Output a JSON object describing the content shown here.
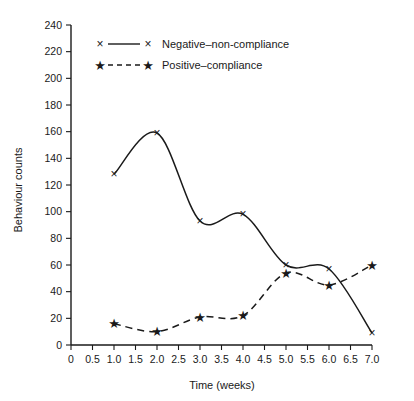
{
  "chart_data": {
    "type": "line",
    "title": "",
    "subtitle": "",
    "xlabel": "Time (weeks)",
    "ylabel": "Behaviour counts",
    "x": [
      1.0,
      2.0,
      3.0,
      4.0,
      5.0,
      6.0,
      7.0
    ],
    "xlim": [
      0,
      7.0
    ],
    "ylim": [
      0,
      240
    ],
    "grid": false,
    "legend_position": "top-left",
    "x_ticks": [
      "0",
      "0.5",
      "1.0",
      "1.5",
      "2.0",
      "2.5",
      "3.0",
      "3.5",
      "4.0",
      "4.5",
      "5.0",
      "5.5",
      "6.0",
      "6.5",
      "7.0"
    ],
    "x_tick_values": [
      0,
      0.5,
      1.0,
      1.5,
      2.0,
      2.5,
      3.0,
      3.5,
      4.0,
      4.5,
      5.0,
      5.5,
      6.0,
      6.5,
      7.0
    ],
    "y_ticks": [
      "0",
      "20",
      "40",
      "60",
      "80",
      "100",
      "120",
      "140",
      "160",
      "180",
      "200",
      "220",
      "240"
    ],
    "y_tick_values": [
      0,
      20,
      40,
      60,
      80,
      100,
      120,
      140,
      160,
      180,
      200,
      220,
      240
    ],
    "series": [
      {
        "name": "Negative–non-compliance",
        "marker": "x",
        "linestyle": "solid",
        "color": "#1a1a1a",
        "values": [
          128,
          159,
          93,
          98,
          60,
          57,
          9
        ]
      },
      {
        "name": "Positive–compliance",
        "marker": "star",
        "linestyle": "dashed",
        "color": "#1a1a1a",
        "values": [
          16,
          10,
          21,
          22,
          54,
          45,
          60
        ]
      }
    ]
  },
  "legend": {
    "entries": [
      {
        "label": "Negative–non-compliance",
        "marker": "×",
        "style": "solid"
      },
      {
        "label": "Positive–compliance",
        "marker": "★",
        "style": "dashed"
      }
    ]
  },
  "markers": {
    "x_glyph": "×",
    "star_glyph": "★"
  }
}
